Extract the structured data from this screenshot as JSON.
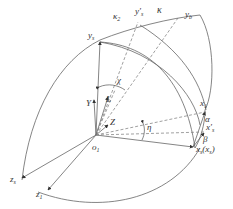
{
  "diagram": {
    "type": "coordinate-frame-rotation",
    "origin": {
      "label": "o",
      "sub": "1"
    },
    "points": {
      "y_s": {
        "label": "y",
        "sub": "s"
      },
      "y_s_prime": {
        "label": "y′",
        "sub": "s"
      },
      "y_b": {
        "label": "y",
        "sub": "b"
      },
      "x_1": {
        "label": "x",
        "sub": "1"
      },
      "x_s_prime": {
        "label": "x′",
        "sub": "s"
      },
      "x_s_xs": {
        "label": "x",
        "sub": "s",
        "extra": "(x",
        "extra_sub": "s",
        "extra_close": ")"
      },
      "z_s": {
        "label": "z",
        "sub": "s"
      },
      "z_1": {
        "label": "z",
        "sub": "1"
      }
    },
    "angles": {
      "kappa": "κ",
      "kappa2": "κ",
      "kappa2_sub": "2",
      "chi": "χ",
      "eta": "η",
      "alpha": "α",
      "beta": "β"
    },
    "vectors": {
      "Y": "Y",
      "L": "L",
      "Z": "Z"
    },
    "colors": {
      "stroke": "#555555",
      "text": "#333333"
    }
  }
}
